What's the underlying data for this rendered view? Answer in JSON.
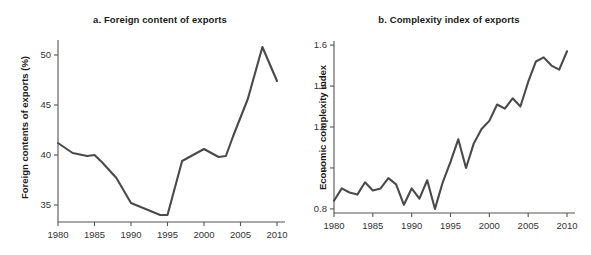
{
  "figure": {
    "background_color": "#ffffff",
    "line_color": "#4a4a4a",
    "axis_color": "#555555",
    "text_color": "#1a1a1a"
  },
  "panel_a": {
    "title": "a. Foreign content of exports",
    "ylabel": "Foreign contents of exports (%)",
    "xlabel": "",
    "y_ticks": [
      "35",
      "40",
      "45",
      "50"
    ],
    "x_ticks": [
      "1980",
      "1985",
      "1990",
      "1995",
      "2000",
      "2005",
      "2010"
    ]
  },
  "panel_b": {
    "title": "b. Complexity index of exports",
    "ylabel": "Economic complexity index",
    "xlabel": "",
    "y_ticks": [
      "0.8",
      "1",
      "1.2",
      "1.4",
      "1.6"
    ],
    "x_ticks": [
      "1980",
      "1985",
      "1990",
      "1995",
      "2000",
      "2005",
      "2010"
    ]
  },
  "chart_data": [
    {
      "type": "line",
      "title": "a. Foreign content of exports",
      "xlabel": "",
      "ylabel": "Foreign contents of exports (%)",
      "xlim": [
        1980,
        2010
      ],
      "ylim": [
        33.3,
        51.5
      ],
      "y_ticks": [
        35,
        40,
        45,
        50
      ],
      "x_ticks": [
        1980,
        1985,
        1990,
        1995,
        2000,
        2005,
        2010
      ],
      "grid": false,
      "legend": null,
      "x": [
        1980,
        1982,
        1984,
        1985,
        1986,
        1988,
        1990,
        1992,
        1994,
        1995,
        1997,
        1999,
        2000,
        2002,
        2003,
        2004,
        2006,
        2008,
        2010
      ],
      "values": [
        41.2,
        40.2,
        39.9,
        40.0,
        39.3,
        37.7,
        35.2,
        34.6,
        34.0,
        34.0,
        39.4,
        40.2,
        40.6,
        39.8,
        39.9,
        41.9,
        45.6,
        50.8,
        47.4
      ]
    },
    {
      "type": "line",
      "title": "b. Complexity index of exports",
      "xlabel": "",
      "ylabel": "Economic complexity index",
      "xlim": [
        1980,
        2010
      ],
      "ylim": [
        0.78,
        1.62
      ],
      "y_ticks": [
        0.8,
        1.0,
        1.2,
        1.4,
        1.6
      ],
      "x_ticks": [
        1980,
        1985,
        1990,
        1995,
        2000,
        2005,
        2010
      ],
      "grid": false,
      "legend": null,
      "x": [
        1980,
        1981,
        1982,
        1983,
        1984,
        1985,
        1986,
        1987,
        1988,
        1989,
        1990,
        1991,
        1992,
        1993,
        1994,
        1995,
        1996,
        1997,
        1998,
        1999,
        2000,
        2001,
        2002,
        2003,
        2004,
        2005,
        2006,
        2007,
        2008,
        2009,
        2010
      ],
      "values": [
        0.84,
        0.9,
        0.88,
        0.87,
        0.93,
        0.89,
        0.9,
        0.95,
        0.92,
        0.82,
        0.9,
        0.85,
        0.94,
        0.8,
        0.93,
        1.03,
        1.14,
        1.0,
        1.12,
        1.19,
        1.23,
        1.31,
        1.29,
        1.34,
        1.3,
        1.42,
        1.52,
        1.54,
        1.5,
        1.48,
        1.57
      ]
    }
  ]
}
